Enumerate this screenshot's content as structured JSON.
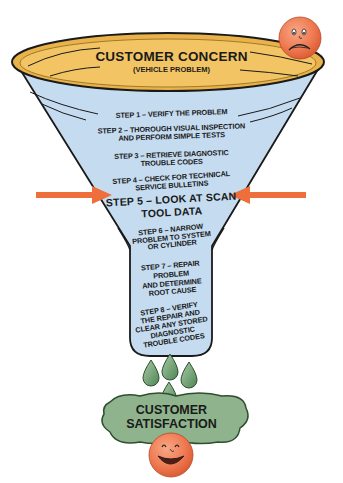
{
  "diagram": {
    "type": "funnel",
    "top": {
      "title": "CUSTOMER CONCERN",
      "subtitle": "(VEHICLE PROBLEM)",
      "face": "sad-face-icon"
    },
    "steps": [
      {
        "lines": [
          "STEP 1 – VERIFY THE PROBLEM"
        ]
      },
      {
        "lines": [
          "STEP 2 – THOROUGH VISUAL INSPECTION",
          "AND PERFORM SIMPLE TESTS"
        ]
      },
      {
        "lines": [
          "STEP 3 – RETRIEVE DIAGNOSTIC",
          "TROUBLE CODES"
        ]
      },
      {
        "lines": [
          "STEP 4 – CHECK FOR TECHNICAL",
          "SERVICE BULLETINS"
        ]
      },
      {
        "lines": [
          "STEP 5 – LOOK AT SCAN",
          "TOOL DATA"
        ],
        "highlighted": true
      },
      {
        "lines": [
          "STEP 6 – NARROW",
          "PROBLEM TO SYSTEM",
          "OR CYLINDER"
        ]
      },
      {
        "lines": [
          "STEP 7 – REPAIR",
          "PROBLEM",
          "AND DETERMINE",
          "ROOT CAUSE"
        ]
      },
      {
        "lines": [
          "STEP 8 – VERIFY",
          "THE REPAIR AND",
          "CLEAR ANY STORED",
          "DIAGNOSTIC",
          "TROUBLE CODES"
        ]
      }
    ],
    "bottom": {
      "lines": [
        "CUSTOMER",
        "SATISFACTION"
      ],
      "face": "happy-face-icon"
    },
    "arrows": {
      "point_to": "step-5",
      "count": 2
    }
  },
  "colors": {
    "rim_fill": "#f2c463",
    "funnel_fill": "#c4dbf0",
    "outline": "#1a1a1a",
    "arrow": "#ee6f3b",
    "face": "#ef7a52",
    "cloud": "#8fb38d",
    "drop": "#6b9d6e"
  }
}
